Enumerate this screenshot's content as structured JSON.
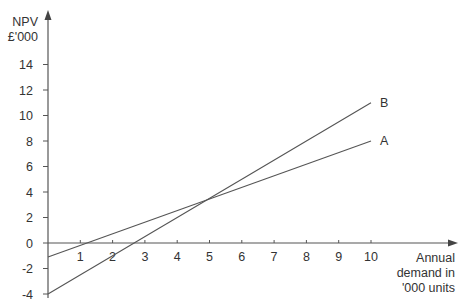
{
  "chart_data": {
    "type": "line",
    "title": "",
    "xlabel": "Annual demand in '000 units",
    "xlabel_lines": [
      "Annual",
      "demand in",
      "'000 units"
    ],
    "ylabel": "NPV £'000",
    "ylabel_lines": [
      "NPV",
      "£'000"
    ],
    "x_ticks": [
      1,
      2,
      3,
      4,
      5,
      6,
      7,
      8,
      9,
      10
    ],
    "y_ticks": [
      -4,
      -2,
      0,
      2,
      4,
      6,
      8,
      10,
      12,
      14
    ],
    "xlim": [
      0,
      10
    ],
    "ylim": [
      -4,
      15
    ],
    "grid": false,
    "legend": "inline labels at line ends",
    "series": [
      {
        "name": "A",
        "x": [
          0,
          10
        ],
        "values": [
          -1.1,
          8
        ]
      },
      {
        "name": "B",
        "x": [
          0,
          10
        ],
        "values": [
          -4,
          11
        ]
      }
    ],
    "annotations": [
      {
        "text": "A",
        "x": 10,
        "y": 8
      },
      {
        "text": "B",
        "x": 10,
        "y": 11
      }
    ],
    "colors": {
      "axis": "#555555",
      "line": "#555555",
      "text": "#333333"
    }
  }
}
